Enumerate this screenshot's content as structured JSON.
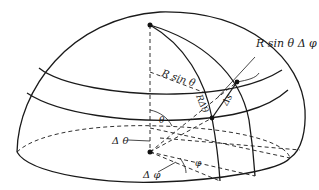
{
  "figure": {
    "labels": {
      "r_sin_theta_dphi": "R sin θ Δ φ",
      "r_sin_theta": "R sin θ",
      "r_dtheta": "RΔθ",
      "ds": "Δs",
      "theta": "θ",
      "d_theta": "Δ θ",
      "phi": "φ",
      "d_phi": "Δ φ"
    },
    "points": {
      "pole": "top of hemisphere",
      "center": "center of base",
      "element_corner_upper": "upper corner of area element",
      "element_corner_lower": "lower corner of area element"
    }
  }
}
